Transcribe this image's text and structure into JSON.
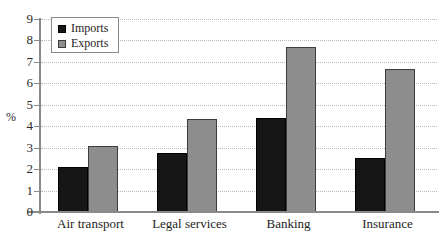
{
  "chart_data": {
    "type": "bar",
    "title": "",
    "xlabel": "",
    "ylabel": "%",
    "ylim": [
      0,
      9
    ],
    "yticks": [
      0,
      1,
      2,
      3,
      4,
      5,
      6,
      7,
      8,
      9
    ],
    "ytick_labels": [
      "0",
      "1",
      "2",
      "3",
      "4",
      "5",
      "6",
      "7",
      "8",
      "9"
    ],
    "grid": true,
    "legend_position": "top-left",
    "categories": [
      "Air transport",
      "Legal services",
      "Banking",
      "Insurance"
    ],
    "series": [
      {
        "name": "Imports",
        "color": "#161616",
        "values": [
          2.1,
          2.75,
          4.4,
          2.5
        ]
      },
      {
        "name": "Exports",
        "color": "#8d8d8d",
        "values": [
          3.1,
          4.35,
          7.7,
          6.65
        ]
      }
    ]
  },
  "legend": {
    "items": [
      {
        "label": "Imports",
        "swatch": "imports"
      },
      {
        "label": "Exports",
        "swatch": "exports"
      }
    ]
  },
  "axes": {
    "y_axis_title": "%"
  }
}
